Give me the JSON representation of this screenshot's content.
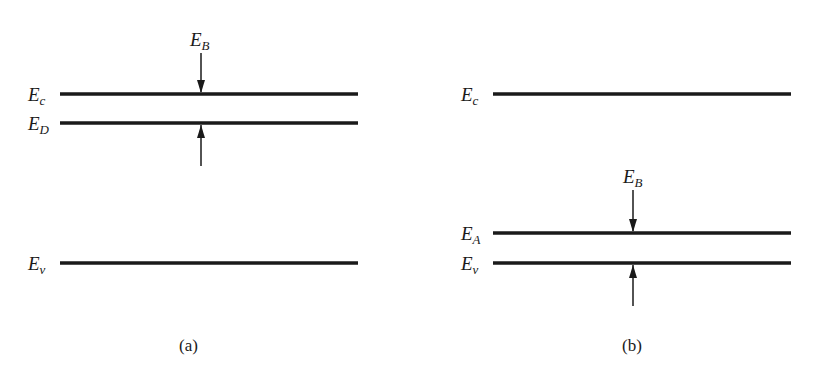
{
  "panels": [
    {
      "id": "a",
      "caption": "(a)",
      "levels": [
        {
          "symbol": "E",
          "sub": "c",
          "y": 94
        },
        {
          "symbol": "E",
          "sub": "D",
          "y": 123
        },
        {
          "symbol": "E",
          "sub": "v",
          "y": 263
        }
      ],
      "gap_label": {
        "symbol": "E",
        "sub": "B"
      },
      "gap_between": [
        "E_c",
        "E_D"
      ]
    },
    {
      "id": "b",
      "caption": "(b)",
      "levels": [
        {
          "symbol": "E",
          "sub": "c",
          "y": 94
        },
        {
          "symbol": "E",
          "sub": "A",
          "y": 233
        },
        {
          "symbol": "E",
          "sub": "v",
          "y": 263
        }
      ],
      "gap_label": {
        "symbol": "E",
        "sub": "B"
      },
      "gap_between": [
        "E_A",
        "E_v"
      ]
    }
  ],
  "colors": {
    "line": "#1a1a1a",
    "background": "#ffffff"
  }
}
